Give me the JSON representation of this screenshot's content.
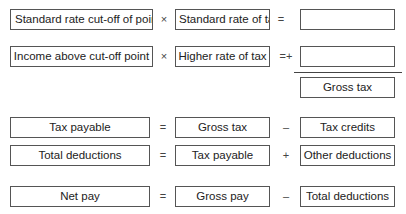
{
  "rows": [
    {
      "left": "Standard rate cut-off of point",
      "op1": "×",
      "middle": "Standard rate of tax",
      "op2": "=",
      "right": ""
    },
    {
      "left": "Income above cut-off point",
      "op1": "×",
      "middle": "Higher rate of tax",
      "op2": "=+",
      "right": ""
    },
    {
      "total": "Gross tax"
    },
    {
      "left": "Tax payable",
      "op1": "=",
      "middle": "Gross tax",
      "op2": "–",
      "right": "Tax credits"
    },
    {
      "left": "Total deductions",
      "op1": "=",
      "middle": "Tax payable",
      "op2": "+",
      "right": "Other deductions"
    },
    {
      "left": "Net pay",
      "op1": "=",
      "middle": "Gross pay",
      "op2": "–",
      "right": "Total deductions"
    }
  ]
}
